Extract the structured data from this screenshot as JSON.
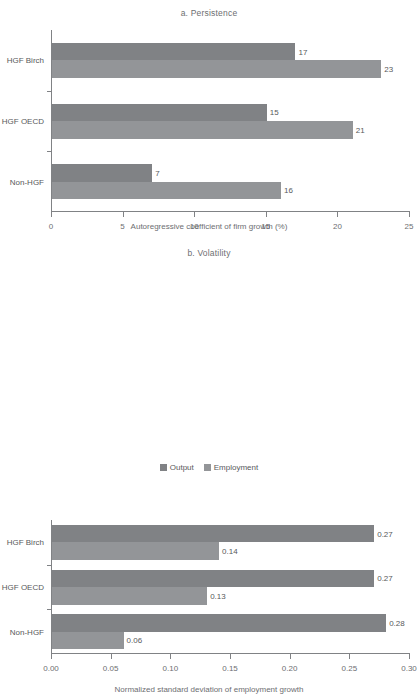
{
  "chart_data": [
    {
      "type": "bar",
      "orientation": "horizontal",
      "panel_id": "a",
      "title": "a. Persistence",
      "xlabel": "Autoregressive coefficient of firm growth (%)",
      "ylabel": "",
      "categories": [
        "HGF Birch",
        "HGF OECD",
        "Non-HGF"
      ],
      "xlim": [
        0,
        25
      ],
      "xticks": [
        0,
        5,
        10,
        15,
        20,
        25
      ],
      "xtick_labels": [
        "0",
        "5",
        "10",
        "15",
        "20",
        "25"
      ],
      "grid": false,
      "legend_position": "bottom",
      "series": [
        {
          "name": "Output",
          "values": [
            17,
            15,
            7
          ],
          "labels": [
            "17",
            "15",
            "7"
          ],
          "color": "#808285"
        },
        {
          "name": "Employment",
          "values": [
            23,
            21,
            16
          ],
          "labels": [
            "23",
            "21",
            "16"
          ],
          "color": "#939598"
        }
      ]
    },
    {
      "type": "bar",
      "orientation": "horizontal",
      "panel_id": "b",
      "title": "b. Volatility",
      "xlabel": "Normalized standard deviation of employment growth",
      "ylabel": "",
      "categories": [
        "HGF Birch",
        "HGF OECD",
        "Non-HGF"
      ],
      "xlim": [
        0,
        0.3
      ],
      "xticks": [
        0,
        0.05,
        0.1,
        0.15,
        0.2,
        0.25,
        0.3
      ],
      "xtick_labels": [
        "0.00",
        "0.05",
        "0.10",
        "0.15",
        "0.20",
        "0.25",
        "0.30"
      ],
      "grid": false,
      "legend_position": "bottom",
      "series": [
        {
          "name": "Output",
          "values": [
            0.27,
            0.27,
            0.28
          ],
          "labels": [
            "0.27",
            "0.27",
            "0.28"
          ],
          "color": "#808285"
        },
        {
          "name": "Employment",
          "values": [
            0.14,
            0.13,
            0.06
          ],
          "labels": [
            "0.14",
            "0.13",
            "0.06"
          ],
          "color": "#939598"
        }
      ]
    }
  ],
  "legend": {
    "items": [
      {
        "label": "Output",
        "color": "#808285"
      },
      {
        "label": "Employment",
        "color": "#939598"
      }
    ]
  }
}
